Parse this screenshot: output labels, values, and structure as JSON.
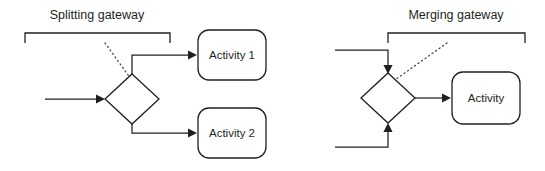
{
  "diagram": {
    "type": "bpmn-gateway-diagram",
    "background_color": "#ffffff",
    "line_color": "#231f20",
    "dotted_leader_color": "#4a4a4a"
  },
  "panels": [
    {
      "id": "splitting",
      "caption": "Splitting gateway",
      "caption_x": 97,
      "caption_y": 19,
      "bracket": {
        "x1": 25,
        "x2": 170,
        "y": 33,
        "tick": 10
      },
      "leader": {
        "x1": 105,
        "y1": 43,
        "x2": 131,
        "y2": 79
      },
      "gateway": {
        "cx": 132,
        "cy": 99,
        "rx": 27,
        "ry": 25,
        "name": "splitting-gateway-diamond"
      },
      "inbound_label": "sequence flow in",
      "nodes": [
        {
          "id": "activity-1",
          "label": "Activity 1",
          "x": 198,
          "y": 30,
          "w": 68,
          "h": 50
        },
        {
          "id": "activity-2",
          "label": "Activity 2",
          "x": 198,
          "y": 108,
          "w": 68,
          "h": 50
        }
      ]
    },
    {
      "id": "merging",
      "caption": "Merging gateway",
      "caption_x": 456,
      "caption_y": 19,
      "bracket": {
        "x1": 388,
        "x2": 525,
        "y": 33,
        "tick": 10
      },
      "leader": {
        "x1": 447,
        "y1": 43,
        "x2": 392,
        "y2": 82
      },
      "gateway": {
        "cx": 388,
        "cy": 98,
        "rx": 27,
        "ry": 25,
        "name": "merging-gateway-diamond"
      },
      "outbound_label": "sequence flow out",
      "nodes": [
        {
          "id": "activity",
          "label": "Activity",
          "x": 452,
          "y": 72,
          "w": 68,
          "h": 52
        }
      ]
    }
  ],
  "connectors": [
    {
      "id": "split-input",
      "from": "start",
      "to": "splitting-gateway",
      "kind": "arrow"
    },
    {
      "id": "split-branch-top",
      "from": "splitting-gateway",
      "to": "activity-1",
      "kind": "arrow"
    },
    {
      "id": "split-branch-bottom",
      "from": "splitting-gateway",
      "to": "activity-2",
      "kind": "arrow"
    },
    {
      "id": "merge-input-top",
      "from": "upper-flow",
      "to": "merging-gateway",
      "kind": "arrow"
    },
    {
      "id": "merge-input-bottom",
      "from": "lower-flow",
      "to": "merging-gateway",
      "kind": "arrow"
    },
    {
      "id": "merge-output",
      "from": "merging-gateway",
      "to": "activity",
      "kind": "arrow"
    }
  ]
}
